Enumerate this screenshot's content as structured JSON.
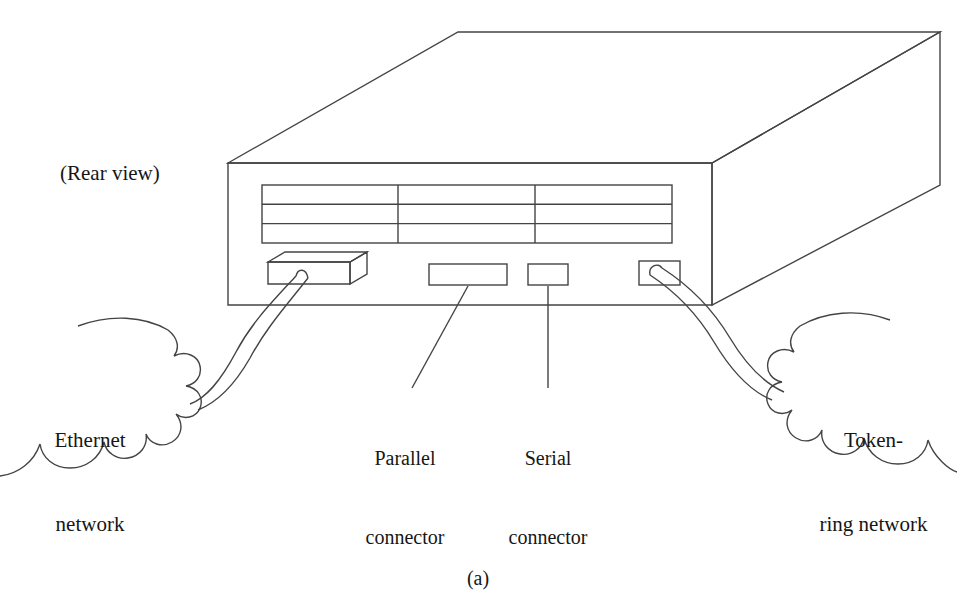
{
  "figure": {
    "caption": "(a)",
    "view_label": "(Rear view)",
    "background_color": "#ffffff",
    "line_color": "#444444",
    "text_color": "#161616"
  },
  "labels": {
    "rear_view": "(Rear view)",
    "ethernet": {
      "line1": "Ethernet",
      "line2": "network"
    },
    "token_ring": {
      "line1": "Token-",
      "line2": "ring network"
    },
    "parallel_connector": {
      "line1": "Parallel",
      "line2": "connector"
    },
    "serial_connector": {
      "line1": "Serial",
      "line2": "connector"
    }
  },
  "device": {
    "name": "network-device-chassis",
    "projection": "isometric",
    "faces": [
      "front",
      "top",
      "right-side"
    ],
    "vent_grille": {
      "rows": 3,
      "columns": 3
    },
    "ports": [
      {
        "name": "ethernet-transceiver-port",
        "type": "transceiver-box",
        "connected": true
      },
      {
        "name": "parallel-connector-port",
        "type": "rectangular-slot",
        "connected": false
      },
      {
        "name": "serial-connector-port",
        "type": "small-rectangular-slot",
        "connected": false
      },
      {
        "name": "token-ring-port",
        "type": "rectangular-slot",
        "connected": true
      }
    ]
  },
  "networks": [
    {
      "name": "ethernet-network-cloud",
      "side": "left",
      "shape": "cloud"
    },
    {
      "name": "token-ring-network-cloud",
      "side": "right",
      "shape": "cloud"
    }
  ],
  "cables": [
    {
      "name": "ethernet-cable",
      "from": "ethernet-transceiver-port",
      "to": "ethernet-network-cloud"
    },
    {
      "name": "token-ring-cable",
      "from": "token-ring-port",
      "to": "token-ring-network-cloud"
    }
  ],
  "leader_lines": [
    {
      "name": "parallel-connector-leader",
      "target": "parallel-connector-port"
    },
    {
      "name": "serial-connector-leader",
      "target": "serial-connector-port"
    }
  ]
}
